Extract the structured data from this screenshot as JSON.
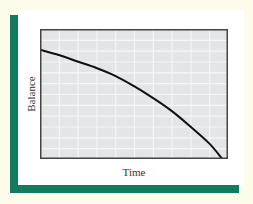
{
  "colors": {
    "background": "#fdfbea",
    "card": "#ffffff",
    "accent_bar": "#117a5f",
    "plot_fill": "#e4e5e6",
    "grid": "#f6f6f6",
    "curve": "#111111",
    "frame": "#444444"
  },
  "chart_data": {
    "type": "line",
    "title": "",
    "xlabel": "Time",
    "ylabel": "Balance",
    "grid": true,
    "legend": null,
    "x_ticks": [],
    "y_ticks": [],
    "series": [
      {
        "name": "Balance",
        "description": "Concave-down declining balance curve reaching zero",
        "x": [
          0,
          0.1,
          0.2,
          0.3,
          0.4,
          0.5,
          0.6,
          0.7,
          0.8,
          0.9,
          0.97
        ],
        "values": [
          0.84,
          0.8,
          0.75,
          0.7,
          0.64,
          0.56,
          0.47,
          0.37,
          0.25,
          0.12,
          0.0
        ]
      }
    ],
    "xlim": [
      0,
      1
    ],
    "ylim": [
      0,
      1
    ]
  }
}
